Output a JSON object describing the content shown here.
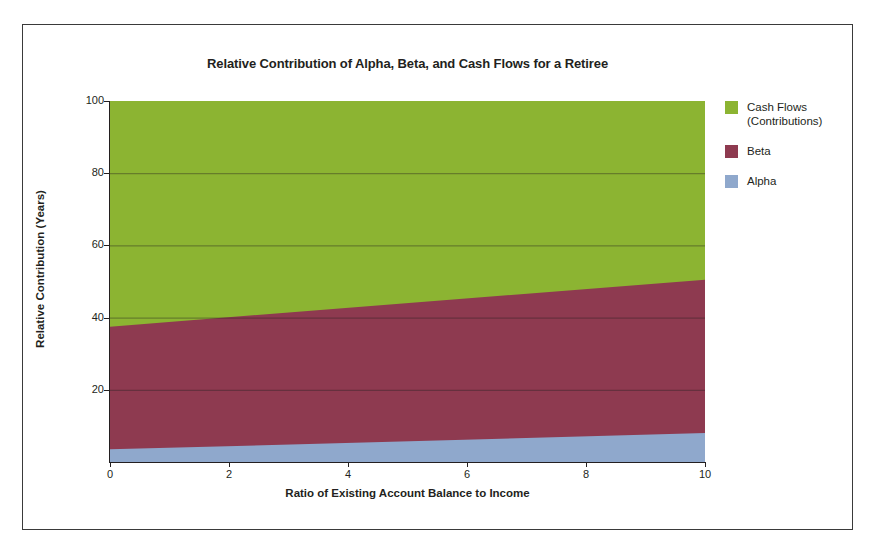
{
  "figure": {
    "background": "#ffffff",
    "frame_color": "#3a3a3a"
  },
  "chart_data": {
    "type": "area",
    "stacked": true,
    "title": "Relative Contribution of Alpha, Beta, and Cash Flows for a Retiree",
    "xlabel": "Ratio of Existing Account Balance to Income",
    "ylabel": "Relative Contribution (Years)",
    "xlim": [
      0,
      10
    ],
    "ylim": [
      0,
      100
    ],
    "xticks": [
      0,
      2,
      4,
      6,
      8,
      10
    ],
    "xtick_labels": [
      "0",
      "2",
      "4",
      "6",
      "8",
      "10"
    ],
    "yticks": [
      20,
      40,
      60,
      80,
      100
    ],
    "ytick_labels": [
      "20",
      "40",
      "60",
      "80",
      "100"
    ],
    "grid": true,
    "grid_axis": "y",
    "legend_position": "right",
    "x": [
      0,
      10
    ],
    "series": [
      {
        "name": "Alpha",
        "color": "#8FA8CC",
        "values": [
          3.5,
          8.0
        ],
        "cumulative_top": [
          3.5,
          8.0
        ]
      },
      {
        "name": "Beta",
        "color": "#8E3A50",
        "values": [
          34.0,
          42.5
        ],
        "cumulative_top": [
          37.5,
          50.5
        ]
      },
      {
        "name": "Cash Flows (Contributions)",
        "color": "#8CB432",
        "values": [
          62.5,
          49.5
        ],
        "cumulative_top": [
          100.0,
          100.0
        ]
      }
    ]
  },
  "legend": {
    "items": [
      {
        "label": "Cash Flows\n(Contributions)",
        "color": "#8CB432"
      },
      {
        "label": "Beta",
        "color": "#8E3A50"
      },
      {
        "label": "Alpha",
        "color": "#8FA8CC"
      }
    ]
  }
}
